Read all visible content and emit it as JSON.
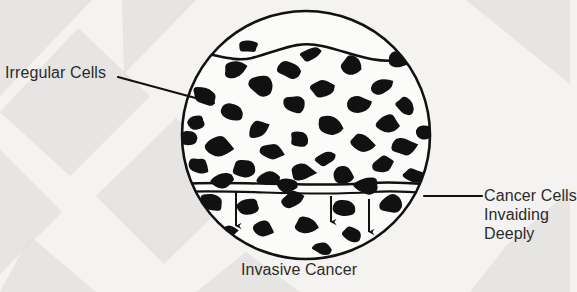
{
  "figure": {
    "title": "Invasive Cancer",
    "caption": "Invasive Cancer",
    "labels": {
      "irregular_cells": "Irregular Cells",
      "cancer_cells_line1": "Cancer Cells",
      "cancer_cells_line2": "Invaiding",
      "cancer_cells_line3": "Deeply"
    },
    "colors": {
      "background": "#f4f3f1",
      "background_shape": "#e3e2e0",
      "ink": "#111111",
      "text": "#2b2b2b",
      "field": "#fbfbf9"
    },
    "geometry": {
      "circle_cx": 306,
      "circle_cy": 135,
      "circle_r": 124,
      "membrane_y": 186,
      "surface_y": 52
    },
    "leader_lines": [
      {
        "name": "leader-irregular-cells",
        "x1": 118,
        "y1": 77,
        "x2": 214,
        "y2": 103
      },
      {
        "name": "leader-cancer-cells",
        "x1": 424,
        "y1": 196,
        "x2": 482,
        "y2": 196
      }
    ],
    "invasion_arrows": [
      {
        "name": "invasion-arrow-1",
        "x": 236,
        "y1": 192,
        "y2": 232
      },
      {
        "name": "invasion-arrow-2",
        "x": 331,
        "y1": 196,
        "y2": 228
      },
      {
        "name": "invasion-arrow-3",
        "x": 369,
        "y1": 199,
        "y2": 238
      }
    ],
    "background_shapes": [
      {
        "name": "bg-chevron-1",
        "points": "0,0 92,0 0,96"
      },
      {
        "name": "bg-chevron-2",
        "points": "0,112 78,28 150,96 70,176"
      },
      {
        "name": "bg-chevron-3",
        "points": "0,150 62,212 0,274"
      },
      {
        "name": "bg-chevron-4",
        "points": "96,196 176,118 244,186 164,264"
      },
      {
        "name": "bg-chevron-5",
        "points": "122,0 196,0 124,74"
      },
      {
        "name": "bg-chevron-6",
        "points": "30,236 96,292 0,292"
      },
      {
        "name": "bg-chevron-7",
        "points": "466,0 570,0 570,84"
      },
      {
        "name": "bg-chevron-8",
        "points": "506,246 570,190 570,292 470,292"
      },
      {
        "name": "bg-chevron-9",
        "points": "246,252 300,292 196,292"
      }
    ],
    "cells_above_membrane": [
      {
        "cx": 205,
        "cy": 96,
        "rx": 13,
        "ry": 9,
        "rot": 22
      },
      {
        "cx": 196,
        "cy": 122,
        "rx": 10,
        "ry": 8,
        "rot": -14
      },
      {
        "cx": 217,
        "cy": 146,
        "rx": 15,
        "ry": 10,
        "rot": 10
      },
      {
        "cx": 198,
        "cy": 166,
        "rx": 11,
        "ry": 9,
        "rot": 30
      },
      {
        "cx": 235,
        "cy": 70,
        "rx": 13,
        "ry": 9,
        "rot": -18
      },
      {
        "cx": 232,
        "cy": 112,
        "rx": 12,
        "ry": 9,
        "rot": 8
      },
      {
        "cx": 244,
        "cy": 168,
        "rx": 13,
        "ry": 10,
        "rot": -8
      },
      {
        "cx": 262,
        "cy": 86,
        "rx": 14,
        "ry": 10,
        "rot": 16
      },
      {
        "cx": 258,
        "cy": 130,
        "rx": 11,
        "ry": 9,
        "rot": -26
      },
      {
        "cx": 272,
        "cy": 152,
        "rx": 12,
        "ry": 9,
        "rot": 12
      },
      {
        "cx": 268,
        "cy": 178,
        "rx": 12,
        "ry": 8,
        "rot": -6
      },
      {
        "cx": 290,
        "cy": 70,
        "rx": 12,
        "ry": 9,
        "rot": 6
      },
      {
        "cx": 294,
        "cy": 104,
        "rx": 13,
        "ry": 10,
        "rot": -20
      },
      {
        "cx": 300,
        "cy": 140,
        "rx": 11,
        "ry": 8,
        "rot": 24
      },
      {
        "cx": 302,
        "cy": 172,
        "rx": 13,
        "ry": 9,
        "rot": 4
      },
      {
        "cx": 322,
        "cy": 88,
        "rx": 12,
        "ry": 9,
        "rot": -12
      },
      {
        "cx": 330,
        "cy": 124,
        "rx": 14,
        "ry": 10,
        "rot": 18
      },
      {
        "cx": 326,
        "cy": 158,
        "rx": 11,
        "ry": 8,
        "rot": -22
      },
      {
        "cx": 344,
        "cy": 176,
        "rx": 12,
        "ry": 9,
        "rot": 8
      },
      {
        "cx": 352,
        "cy": 66,
        "rx": 13,
        "ry": 10,
        "rot": 20
      },
      {
        "cx": 358,
        "cy": 104,
        "rx": 12,
        "ry": 9,
        "rot": -10
      },
      {
        "cx": 362,
        "cy": 142,
        "rx": 13,
        "ry": 9,
        "rot": 14
      },
      {
        "cx": 382,
        "cy": 86,
        "rx": 12,
        "ry": 9,
        "rot": -24
      },
      {
        "cx": 388,
        "cy": 124,
        "rx": 13,
        "ry": 10,
        "rot": 10
      },
      {
        "cx": 384,
        "cy": 164,
        "rx": 12,
        "ry": 9,
        "rot": -16
      },
      {
        "cx": 406,
        "cy": 106,
        "rx": 11,
        "ry": 8,
        "rot": 26
      },
      {
        "cx": 404,
        "cy": 146,
        "rx": 12,
        "ry": 9,
        "rot": -6
      },
      {
        "cx": 414,
        "cy": 176,
        "rx": 11,
        "ry": 8,
        "rot": 16
      },
      {
        "cx": 222,
        "cy": 182,
        "rx": 12,
        "ry": 8,
        "rot": -12
      },
      {
        "cx": 286,
        "cy": 186,
        "rx": 12,
        "ry": 8,
        "rot": 10
      },
      {
        "cx": 366,
        "cy": 186,
        "rx": 13,
        "ry": 9,
        "rot": -8
      },
      {
        "cx": 248,
        "cy": 46,
        "rx": 11,
        "ry": 7,
        "rot": 12
      },
      {
        "cx": 310,
        "cy": 54,
        "rx": 10,
        "ry": 7,
        "rot": -14
      },
      {
        "cx": 398,
        "cy": 60,
        "rx": 11,
        "ry": 8,
        "rot": 18
      },
      {
        "cx": 188,
        "cy": 138,
        "rx": 9,
        "ry": 7,
        "rot": 0
      },
      {
        "cx": 424,
        "cy": 132,
        "rx": 9,
        "ry": 7,
        "rot": 0
      }
    ],
    "cells_below_membrane": [
      {
        "cx": 212,
        "cy": 202,
        "rx": 12,
        "ry": 9,
        "rot": 14
      },
      {
        "cx": 248,
        "cy": 206,
        "rx": 13,
        "ry": 9,
        "rot": -10
      },
      {
        "cx": 262,
        "cy": 228,
        "rx": 11,
        "ry": 8,
        "rot": 20
      },
      {
        "cx": 292,
        "cy": 200,
        "rx": 12,
        "ry": 9,
        "rot": -18
      },
      {
        "cx": 306,
        "cy": 226,
        "rx": 13,
        "ry": 9,
        "rot": 8
      },
      {
        "cx": 344,
        "cy": 208,
        "rx": 12,
        "ry": 9,
        "rot": -6
      },
      {
        "cx": 352,
        "cy": 234,
        "rx": 11,
        "ry": 8,
        "rot": 16
      },
      {
        "cx": 392,
        "cy": 204,
        "rx": 13,
        "ry": 9,
        "rot": -14
      },
      {
        "cx": 404,
        "cy": 228,
        "rx": 11,
        "ry": 8,
        "rot": 10
      },
      {
        "cx": 228,
        "cy": 232,
        "rx": 10,
        "ry": 7,
        "rot": -8
      },
      {
        "cx": 322,
        "cy": 248,
        "rx": 10,
        "ry": 7,
        "rot": 12
      },
      {
        "cx": 378,
        "cy": 250,
        "rx": 9,
        "ry": 7,
        "rot": -12
      }
    ]
  }
}
